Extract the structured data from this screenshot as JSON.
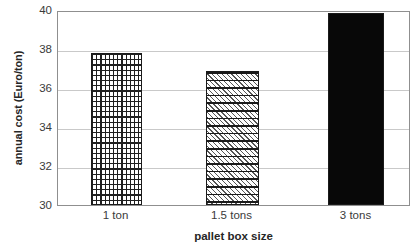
{
  "chart_data": {
    "type": "bar",
    "title": "",
    "categories": [
      "1 ton",
      "1.5 tons",
      "3 tons"
    ],
    "values": [
      37.8,
      36.9,
      39.85
    ],
    "xlabel": "pallet box size",
    "ylabel": "annual cost (Euro/ton)",
    "ylim": [
      30,
      40
    ],
    "yticks": [
      30,
      32,
      34,
      36,
      38,
      40
    ],
    "ytick_labels": [
      "30",
      "32",
      "34",
      "36",
      "38",
      "40"
    ],
    "grid": true,
    "legend": false,
    "series": [
      {
        "name": "annual cost",
        "values": [
          37.8,
          36.9,
          39.85
        ],
        "fills": [
          "grid-crosshatch",
          "horizontal-bands-diagonal-hatch",
          "solid-black"
        ]
      }
    ],
    "colors": {
      "frame": "#8f8f8f",
      "gridline": "#c9c9c9",
      "bar_outline": "#1a1a1a",
      "bar_solid": "#080808",
      "text": "#3a3a3a",
      "background": "#ffffff"
    }
  },
  "axes": {
    "y": {
      "title": "annual cost (Euro/ton)",
      "ticks": [
        {
          "label": "40",
          "value": 40
        },
        {
          "label": "38",
          "value": 38
        },
        {
          "label": "36",
          "value": 36
        },
        {
          "label": "34",
          "value": 34
        },
        {
          "label": "32",
          "value": 32
        },
        {
          "label": "30",
          "value": 30
        }
      ]
    },
    "x": {
      "title": "pallet box size",
      "ticks": [
        {
          "label": "1 ton"
        },
        {
          "label": "1.5 tons"
        },
        {
          "label": "3 tons"
        }
      ]
    }
  }
}
